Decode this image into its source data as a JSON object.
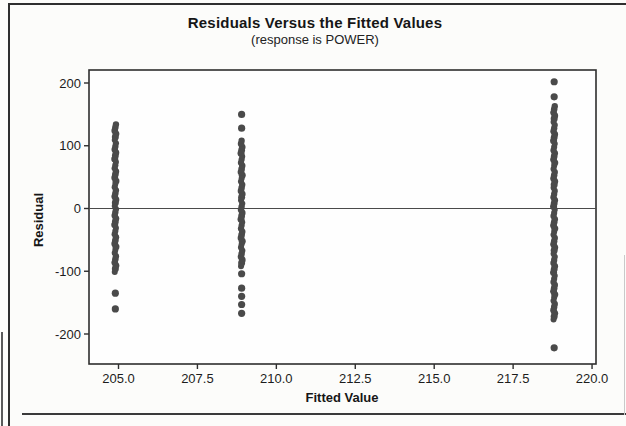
{
  "chart_data": {
    "type": "scatter",
    "title": "Residuals Versus the Fitted Values",
    "subtitle": "(response is POWER)",
    "xlabel": "Fitted Value",
    "ylabel": "Residual",
    "xlim": [
      204.0,
      220.2
    ],
    "ylim": [
      -250,
      220
    ],
    "x_tick_labels": [
      "205.0",
      "207.5",
      "210.0",
      "212.5",
      "215.0",
      "217.5",
      "220.0"
    ],
    "x_tick_values": [
      205.0,
      207.5,
      210.0,
      212.5,
      215.0,
      217.5,
      220.0
    ],
    "y_tick_labels": [
      "200",
      "100",
      "0",
      "-100",
      "-200"
    ],
    "y_tick_values": [
      200,
      100,
      0,
      -100,
      -200
    ],
    "reference_line_y": 0,
    "grid": false,
    "legend": "none",
    "point_color": "#4a4a4a",
    "frame_color": "#2e2e2e",
    "series": [
      {
        "name": "cluster-fitted-204.9",
        "fitted": 204.9,
        "dense_range": [
          -101,
          136
        ],
        "outliers": [
          -135,
          -160
        ]
      },
      {
        "name": "cluster-fitted-208.9",
        "fitted": 208.9,
        "dense_range": [
          -92,
          112
        ],
        "outliers": [
          150,
          128,
          -104,
          -127,
          -140,
          -153,
          -167
        ]
      },
      {
        "name": "cluster-fitted-218.8",
        "fitted": 218.8,
        "dense_range": [
          -177,
          165
        ],
        "outliers": [
          202,
          178,
          -222
        ]
      }
    ]
  }
}
